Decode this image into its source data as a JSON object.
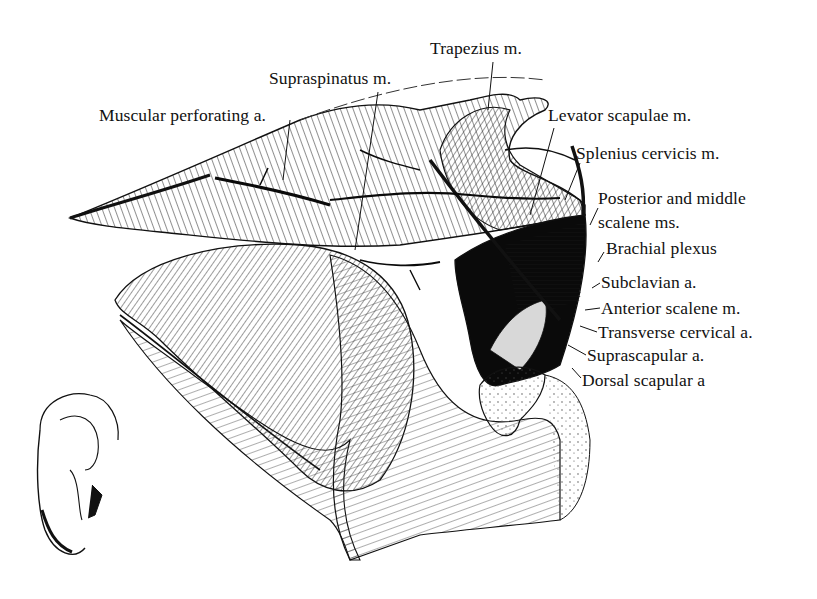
{
  "figure": {
    "type": "anatomical-illustration",
    "ink_color": "#111111",
    "background_color": "#ffffff"
  },
  "labels": [
    {
      "id": "trapezius",
      "text": "Trapezius m.",
      "x": 430,
      "y": 38
    },
    {
      "id": "supraspinatus",
      "text": "Supraspinatus m.",
      "x": 269,
      "y": 68
    },
    {
      "id": "muscular-perforating",
      "text": "Muscular perforating a.",
      "x": 99,
      "y": 105
    },
    {
      "id": "levator-scapulae",
      "text": "Levator scapulae m.",
      "x": 548,
      "y": 105
    },
    {
      "id": "splenius-cervicis",
      "text": "Splenius cervicis m.",
      "x": 576,
      "y": 143
    },
    {
      "id": "posterior-middle-scalene-1",
      "text": "Posterior and middle",
      "x": 598,
      "y": 188
    },
    {
      "id": "posterior-middle-scalene-2",
      "text": "scalene ms.",
      "x": 598,
      "y": 212
    },
    {
      "id": "brachial-plexus",
      "text": "Brachial plexus",
      "x": 606,
      "y": 238
    },
    {
      "id": "subclavian",
      "text": "Subclavian a.",
      "x": 601,
      "y": 272
    },
    {
      "id": "anterior-scalene",
      "text": "Anterior scalene m.",
      "x": 601,
      "y": 298
    },
    {
      "id": "transverse-cervical",
      "text": "Transverse cervical a.",
      "x": 598,
      "y": 322
    },
    {
      "id": "suprascapular",
      "text": "Suprascapular a.",
      "x": 587,
      "y": 345
    },
    {
      "id": "dorsal-scapular",
      "text": "Dorsal scapular a",
      "x": 582,
      "y": 370
    }
  ]
}
